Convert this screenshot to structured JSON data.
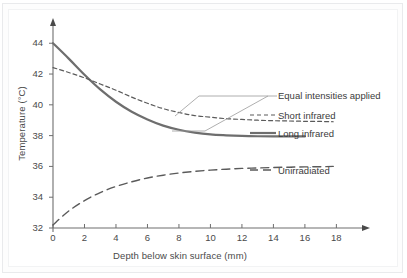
{
  "chart_data": {
    "type": "line",
    "title": "",
    "xlabel": "Depth below skin surface (mm)",
    "ylabel": "Temperature (°C)",
    "xlim": [
      0,
      19.5
    ],
    "ylim": [
      32,
      44.6
    ],
    "xticks": [
      0,
      2,
      4,
      6,
      8,
      10,
      12,
      14,
      16,
      18
    ],
    "yticks": [
      32,
      34,
      36,
      38,
      40,
      42,
      44
    ],
    "xtick_labels": [
      "0",
      "2",
      "4",
      "6",
      "8",
      "10",
      "12",
      "14",
      "16",
      "18"
    ],
    "ytick_labels": [
      "32",
      "34",
      "36",
      "38",
      "40",
      "42",
      "44"
    ],
    "grid": false,
    "legend_position": "right-inline-labels",
    "annotations": [
      {
        "text": "Equal intensities applied",
        "points_to": [
          "Short infrared",
          "Long infrared"
        ],
        "style": "bracket-leader"
      }
    ],
    "series": [
      {
        "name": "Long infrared",
        "label": "Long infrared",
        "style": "solid",
        "color": "#6e6e6e",
        "width": 2.2,
        "x": [
          0,
          1,
          2,
          3,
          4,
          5,
          6,
          7,
          8,
          9,
          10,
          11,
          12,
          13,
          14,
          15,
          16
        ],
        "y": [
          44.0,
          43.0,
          41.95,
          41.0,
          40.2,
          39.55,
          39.05,
          38.65,
          38.38,
          38.2,
          38.08,
          38.02,
          37.98,
          37.96,
          37.95,
          37.95,
          37.95
        ]
      },
      {
        "name": "Short infrared",
        "label": "Short infrared",
        "style": "dashed-short",
        "color": "#5a5a5a",
        "width": 1.2,
        "x": [
          0,
          1,
          2,
          3,
          4,
          5,
          6,
          7,
          8,
          9,
          10,
          11,
          12,
          13,
          14,
          15,
          16,
          17,
          17.8
        ],
        "y": [
          42.42,
          42.1,
          41.75,
          41.35,
          40.95,
          40.5,
          40.1,
          39.75,
          39.5,
          39.3,
          39.2,
          39.1,
          39.05,
          39.0,
          38.97,
          38.95,
          38.93,
          38.92,
          38.9
        ]
      },
      {
        "name": "Unirradiated",
        "label": "Unirradiated",
        "style": "dashed-long",
        "color": "#5a5a5a",
        "width": 1.4,
        "x": [
          0,
          1,
          2,
          3,
          4,
          5,
          6,
          7,
          8,
          9,
          10,
          11,
          12,
          13,
          14,
          15,
          16,
          17,
          17.8
        ],
        "y": [
          32.2,
          33.1,
          33.78,
          34.3,
          34.7,
          35.0,
          35.25,
          35.43,
          35.57,
          35.68,
          35.76,
          35.82,
          35.87,
          35.9,
          35.93,
          35.95,
          35.97,
          35.98,
          36.0
        ]
      }
    ]
  },
  "labels": {
    "equal_intensities": "Equal intensities applied",
    "short_infrared": "Short infrared",
    "long_infrared": "Long infrared",
    "unirradiated": "Unirradiated"
  },
  "colors": {
    "axis": "#6e6e6e",
    "text": "#4a4a4a",
    "solid_series": "#6e6e6e",
    "dashed_series": "#5a5a5a",
    "leader": "#8a8a8a",
    "frame": "#e9eaec"
  }
}
